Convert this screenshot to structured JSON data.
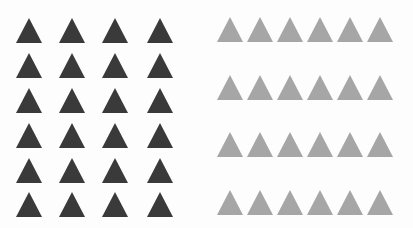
{
  "figure": {
    "groups": [
      {
        "name": "uniform-grid",
        "shape": "triangle",
        "color": "#3a3a3a",
        "rows": 6,
        "columns": 4,
        "arrangement": "evenly spaced grid"
      },
      {
        "name": "proximity-rows",
        "shape": "triangle",
        "color": "#a6a6a6",
        "rows": 4,
        "columns": 6,
        "arrangement": "tightly packed horizontal rows with wide vertical gaps"
      }
    ]
  }
}
